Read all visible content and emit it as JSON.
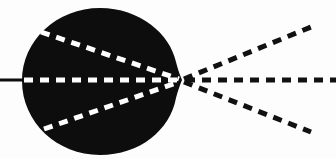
{
  "figure": {
    "width": 336,
    "height": 159,
    "background_color": "#fdfdfd",
    "shape_color": "#0d0d0d",
    "internal_ray_color": "#ffffff",
    "external_ray_color": "#111111",
    "incoming_line_color": "#0d0d0d"
  },
  "body_shape": {
    "name": "lens-blob",
    "description": "solid black rounded blob with pointed right tip",
    "left_x": 22,
    "right_tip_x": 182,
    "top_y": 8,
    "bottom_y": 155,
    "center_x": 100,
    "center_y": 81,
    "radius_x": 79,
    "radius_y": 73
  },
  "focus_point": {
    "name": "focal-point",
    "x": 181,
    "y": 80
  },
  "incoming_axis_line": {
    "name": "incoming-axis-line",
    "x1": 0,
    "y1": 80,
    "x2": 30,
    "y2": 80,
    "style": "solid",
    "width": 3
  },
  "internal_rays": [
    {
      "name": "internal-ray-upper",
      "x1": 41,
      "y1": 32,
      "x2": 179,
      "y2": 79,
      "style": "dashed",
      "color": "#ffffff"
    },
    {
      "name": "internal-ray-axis",
      "x1": 24,
      "y1": 80,
      "x2": 180,
      "y2": 80,
      "style": "dashed",
      "color": "#ffffff"
    },
    {
      "name": "internal-ray-lower",
      "x1": 44,
      "y1": 129,
      "x2": 179,
      "y2": 82,
      "style": "dashed",
      "color": "#ffffff"
    }
  ],
  "external_rays": [
    {
      "name": "external-ray-upper",
      "x1": 184,
      "y1": 79,
      "x2": 311,
      "y2": 27,
      "style": "dashed",
      "color": "#111111"
    },
    {
      "name": "external-ray-axis",
      "x1": 186,
      "y1": 80,
      "x2": 336,
      "y2": 80,
      "style": "dashed",
      "color": "#111111"
    },
    {
      "name": "external-ray-lower",
      "x1": 184,
      "y1": 82,
      "x2": 311,
      "y2": 132,
      "style": "dashed",
      "color": "#111111"
    }
  ],
  "dash_pattern": {
    "internal": "9 7",
    "external": "9 7",
    "stroke_width": 5
  }
}
